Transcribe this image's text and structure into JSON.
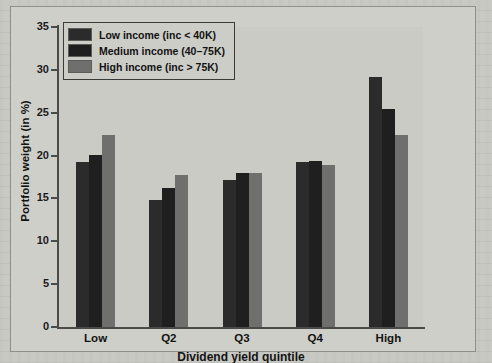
{
  "chart_data": {
    "type": "bar",
    "title": "",
    "subtitle": "",
    "xlabel": "Dividend yield quintile",
    "ylabel": "Portfolio weight (in %)",
    "categories": [
      "Low",
      "Q2",
      "Q3",
      "Q4",
      "High"
    ],
    "ylim": [
      0,
      35
    ],
    "yticks": [
      0,
      5,
      10,
      15,
      20,
      25,
      30,
      35
    ],
    "grid": false,
    "legend_position": "top-left",
    "series": [
      {
        "name": "Low income (inc < 40K)",
        "color": "#2b2b2b",
        "values": [
          19.3,
          14.8,
          17.1,
          19.3,
          29.2
        ]
      },
      {
        "name": "Medium income (40–75K)",
        "color": "#1f1f1f",
        "values": [
          20.1,
          16.2,
          18.0,
          19.4,
          25.4
        ]
      },
      {
        "name": "High income (inc > 75K)",
        "color": "#6f6f6d",
        "values": [
          22.4,
          17.7,
          18.0,
          18.9,
          22.4
        ]
      }
    ]
  },
  "legend": {
    "items": [
      {
        "label": "Low income (inc < 40K)",
        "color": "#2b2b2b"
      },
      {
        "label": "Medium income (40–75K)",
        "color": "#1f1f1f"
      },
      {
        "label": "High income (inc > 75K)",
        "color": "#6f6f6d"
      }
    ]
  },
  "axes": {
    "y_tick_labels": [
      "35",
      "30",
      "25",
      "20",
      "15",
      "10",
      "5",
      "0"
    ],
    "y_axis_title": "Portfolio weight (in %)",
    "x_tick_labels": [
      "Low",
      "Q2",
      "Q3",
      "Q4",
      "High"
    ],
    "x_axis_title": "Dividend yield quintile"
  },
  "colors": {
    "page_background": "#c9c9c4",
    "plot_background": "#cbcbc6",
    "axis": "#4a4a48",
    "text": "#131313"
  }
}
